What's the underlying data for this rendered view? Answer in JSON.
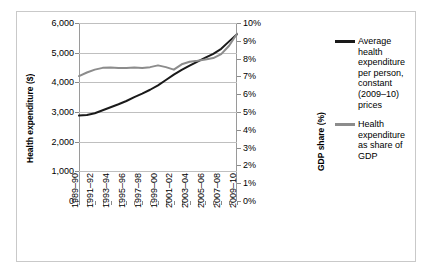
{
  "chart_data": {
    "type": "line",
    "title": "",
    "xlabel": "",
    "ylabel": "Health expenditure ($)",
    "y2label": "GDP share (%)",
    "grid": true,
    "legend_position": "right",
    "ylim": [
      0,
      6000
    ],
    "y2lim": [
      0,
      0.1
    ],
    "y_ticks": [
      "0",
      "1,000",
      "2,000",
      "3,000",
      "4,000",
      "5,000",
      "6,000"
    ],
    "y_tick_values": [
      0,
      1000,
      2000,
      3000,
      4000,
      5000,
      6000
    ],
    "y2_ticks": [
      "0%",
      "1%",
      "2%",
      "3%",
      "4%",
      "5%",
      "6%",
      "7%",
      "8%",
      "9%",
      "10%"
    ],
    "y2_tick_values": [
      0,
      1,
      2,
      3,
      4,
      5,
      6,
      7,
      8,
      9,
      10
    ],
    "x": [
      "1989-90",
      "1990-91",
      "1991-92",
      "1992-93",
      "1993-94",
      "1994-95",
      "1995-96",
      "1996-97",
      "1997-98",
      "1998-99",
      "1999-00",
      "2000-01",
      "2001-02",
      "2002-03",
      "2003-04",
      "2004-05",
      "2005-06",
      "2006-07",
      "2007-08",
      "2008-09",
      "2009-10"
    ],
    "x_tick_labels": [
      "1989–90",
      "1991–92",
      "1993–94",
      "1995–96",
      "1997–98",
      "1999–00",
      "2001–02",
      "2003–04",
      "2005–06",
      "2007–08",
      "2009–10"
    ],
    "x_tick_indices": [
      0,
      2,
      4,
      6,
      8,
      10,
      12,
      14,
      16,
      18,
      20
    ],
    "series": [
      {
        "name": "Average health expenditure per person, constant (2009–10) prices",
        "axis": "left",
        "color": "#1a1a1a",
        "values": [
          2880,
          2900,
          2960,
          3060,
          3160,
          3260,
          3370,
          3500,
          3620,
          3750,
          3900,
          4080,
          4260,
          4420,
          4560,
          4700,
          4830,
          4960,
          5130,
          5380,
          5620
        ]
      },
      {
        "name": "Health expenditure as share of GDP",
        "axis": "right",
        "color": "#8c8c8c",
        "values": [
          7.02,
          7.22,
          7.38,
          7.48,
          7.5,
          7.47,
          7.47,
          7.5,
          7.47,
          7.52,
          7.62,
          7.52,
          7.38,
          7.68,
          7.82,
          7.88,
          7.95,
          8.03,
          8.25,
          8.72,
          9.4
        ]
      }
    ]
  },
  "legend": {
    "entries": [
      {
        "label": "Average health expenditure per person, constant (2009–10) prices",
        "color": "#1a1a1a"
      },
      {
        "label": "Health expenditure as share of GDP",
        "color": "#8c8c8c"
      }
    ]
  },
  "axes": {
    "left_title": "Health expenditure ($)",
    "right_title": "GDP share (%)"
  }
}
